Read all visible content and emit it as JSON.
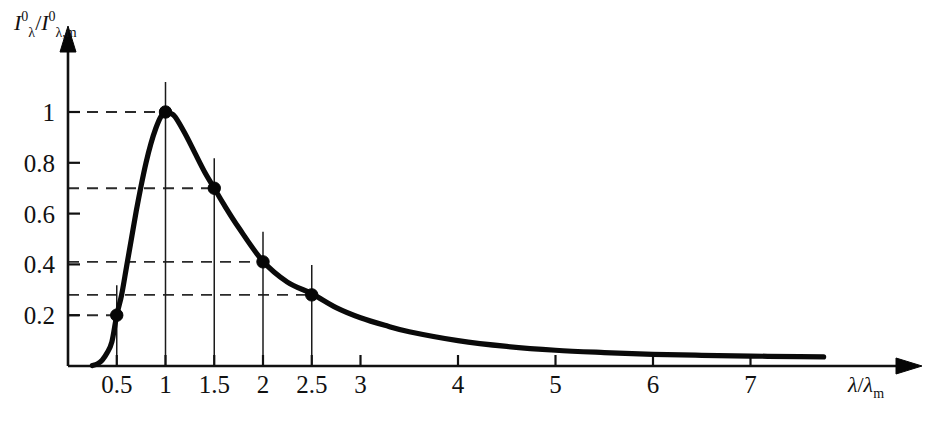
{
  "chart_data": {
    "type": "line",
    "title": "",
    "subtitle": "",
    "xlabel": "λ / λm",
    "ylabel": "I⁰λ / I⁰λ,m",
    "xlim": [
      0,
      7.8
    ],
    "ylim": [
      0,
      1.12
    ],
    "grid": false,
    "legend": "none",
    "xticks": [
      0.5,
      1,
      1.5,
      2,
      2.5,
      3,
      4,
      5,
      6,
      7
    ],
    "xticklabels": [
      "0.5",
      "1",
      "1.5",
      "2",
      "2.5",
      "3",
      "4",
      "5",
      "6",
      "7"
    ],
    "yticks": [
      0.2,
      0.4,
      0.6,
      0.8,
      1
    ],
    "yticklabels": [
      "0.2",
      "0.4",
      "0.6",
      "0.8",
      "1"
    ],
    "series": [
      {
        "name": "normalized spectral emissive power",
        "color": "#0a0a0a",
        "x": [
          0.25,
          0.3,
          0.35,
          0.4,
          0.45,
          0.5,
          0.55,
          0.6,
          0.65,
          0.7,
          0.75,
          0.8,
          0.85,
          0.9,
          0.95,
          1.0,
          1.05,
          1.1,
          1.2,
          1.3,
          1.4,
          1.5,
          1.6,
          1.75,
          2.0,
          2.25,
          2.5,
          2.75,
          3.0,
          3.25,
          3.5,
          4.0,
          4.5,
          5.0,
          5.5,
          6.0,
          6.5,
          7.0,
          7.5,
          7.75
        ],
        "y": [
          0.002,
          0.008,
          0.023,
          0.051,
          0.095,
          0.2,
          0.28,
          0.39,
          0.5,
          0.61,
          0.71,
          0.8,
          0.875,
          0.935,
          0.98,
          1.0,
          0.995,
          0.98,
          0.915,
          0.84,
          0.765,
          0.7,
          0.635,
          0.545,
          0.412,
          0.33,
          0.285,
          0.23,
          0.19,
          0.16,
          0.135,
          0.1,
          0.077,
          0.062,
          0.053,
          0.046,
          0.042,
          0.039,
          0.037,
          0.036
        ]
      }
    ],
    "markers": [
      {
        "x": 0.5,
        "y": 0.2,
        "label": "0.2"
      },
      {
        "x": 1.0,
        "y": 1.0,
        "label": "1"
      },
      {
        "x": 1.5,
        "y": 0.7,
        "label": "0.7"
      },
      {
        "x": 2.0,
        "y": 0.41,
        "label": "0.41"
      },
      {
        "x": 2.5,
        "y": 0.28,
        "label": "0.28"
      }
    ],
    "guide_lines": {
      "description": "horizontal dashed lines from y-axis to each marker and vertical solid droplines from x-axis up through each marker",
      "horizontal_at": [
        0.2,
        0.28,
        0.41,
        0.7,
        1.0
      ],
      "vertical_at": [
        0.5,
        1.0,
        1.5,
        2.0,
        2.5
      ]
    }
  },
  "axis_label_parts": {
    "y": {
      "num_sym": "I",
      "num_sup": "0",
      "num_sub": "λ",
      "slash": "/",
      "den_sym": "I",
      "den_sup": "0",
      "den_sub": "λ,m"
    },
    "x": {
      "num": "λ",
      "slash": "/",
      "den_sym": "λ",
      "den_sub": "m"
    }
  }
}
